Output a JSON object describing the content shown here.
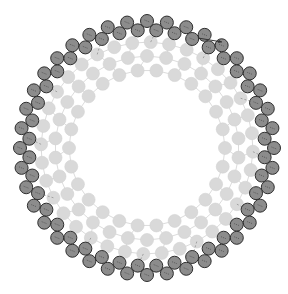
{
  "diagram": {
    "type": "molecular-ring",
    "width": 288,
    "height": 294,
    "center": [
      147,
      148
    ],
    "colors": {
      "background": "#ffffff",
      "dark_fill": "#8c8c8c",
      "dark_stroke": "#2e2e2e",
      "light_fill": "#d9d9d9",
      "light_stroke": "#d2d2d2",
      "bond_light": "#dcdcdc",
      "dash_line": "#3a3a3a",
      "arrow": "#333333"
    },
    "dark_rings": [
      {
        "name": "outer-dark-a",
        "radius": 127,
        "count": 40,
        "offset_deg": 0,
        "bead_r": 6.5
      },
      {
        "name": "outer-dark-b",
        "radius": 118,
        "count": 40,
        "offset_deg": 4.5,
        "bead_r": 6.5
      }
    ],
    "light_rings": [
      {
        "name": "light-ring-1",
        "radius": 106,
        "count": 36,
        "offset_deg": 2,
        "bead_r": 6.5
      },
      {
        "name": "light-ring-2",
        "radius": 92,
        "count": 30,
        "offset_deg": 6,
        "bead_r": 6.5
      },
      {
        "name": "light-ring-3",
        "radius": 78,
        "count": 26,
        "offset_deg": 0,
        "bead_r": 6.5
      }
    ],
    "arrow": {
      "from": [
        198,
        38
      ],
      "to": [
        222,
        42
      ]
    }
  }
}
